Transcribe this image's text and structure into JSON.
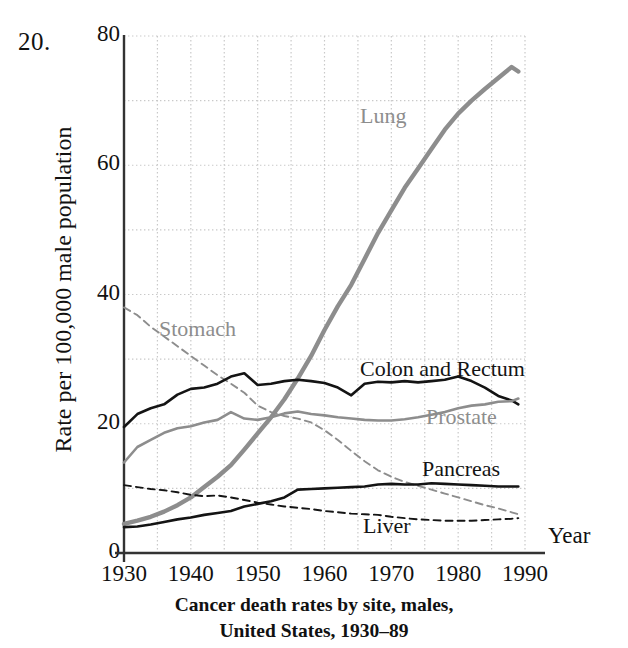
{
  "problem_number": "20.",
  "axis_x_name": "Year",
  "caption_line1": "Cancer death rates by site, males,",
  "caption_line2": "United States, 1930–89",
  "colors": {
    "black_series": "#141414",
    "gray_series": "#8d8d8d",
    "grid": "#c9c9c9",
    "axis": "#333333",
    "background": "#ffffff"
  },
  "labels": {
    "lung": "Lung",
    "stomach": "Stomach",
    "colon": "Colon and Rectum",
    "prostate": "Prostate",
    "pancreas": "Pancreas",
    "liver": "Liver"
  },
  "chart_data": {
    "type": "line",
    "title": "Cancer death rates by site, males, United States, 1930–89",
    "xlabel": "Year",
    "ylabel": "Rate per 100,000 male population",
    "xlim": [
      1930,
      1990
    ],
    "ylim": [
      0,
      80
    ],
    "xticks": [
      1930,
      1940,
      1950,
      1960,
      1970,
      1980,
      1990
    ],
    "yticks": [
      0,
      20,
      40,
      60,
      80
    ],
    "grid": "dotted, major at y every 10 and x every 5 years",
    "legend": "inline annotations next to each curve",
    "x": [
      1930,
      1932,
      1934,
      1936,
      1938,
      1940,
      1942,
      1944,
      1946,
      1948,
      1950,
      1952,
      1954,
      1956,
      1958,
      1960,
      1962,
      1964,
      1966,
      1968,
      1970,
      1972,
      1974,
      1976,
      1978,
      1980,
      1982,
      1984,
      1986,
      1988,
      1989
    ],
    "series": [
      {
        "name": "Lung",
        "style": "solid",
        "color": "#8d8d8d",
        "width": "thick",
        "values": [
          4.5,
          5.0,
          5.6,
          6.4,
          7.4,
          8.6,
          10.2,
          11.8,
          13.6,
          16.0,
          18.5,
          21.0,
          23.8,
          27.0,
          30.5,
          34.5,
          38.2,
          41.5,
          45.5,
          49.5,
          53.0,
          56.5,
          59.5,
          62.5,
          65.5,
          68.0,
          70.0,
          71.8,
          73.5,
          75.2,
          74.5
        ]
      },
      {
        "name": "Stomach",
        "style": "dashed",
        "color": "#8d8d8d",
        "width": "thin",
        "values": [
          38.0,
          36.8,
          35.0,
          33.5,
          32.0,
          30.5,
          29.0,
          27.5,
          26.2,
          24.8,
          22.8,
          21.8,
          21.2,
          20.8,
          20.2,
          19.0,
          17.5,
          15.8,
          14.2,
          12.8,
          11.8,
          11.0,
          10.4,
          9.8,
          9.2,
          8.6,
          8.0,
          7.4,
          6.9,
          6.3,
          6.0
        ]
      },
      {
        "name": "Colon and Rectum",
        "style": "solid",
        "color": "#141414",
        "width": "medium",
        "values": [
          19.5,
          21.5,
          22.4,
          23.0,
          24.5,
          25.4,
          25.6,
          26.2,
          27.3,
          27.8,
          26.0,
          26.2,
          26.6,
          26.8,
          26.6,
          26.3,
          25.6,
          24.4,
          26.2,
          26.5,
          26.4,
          26.6,
          26.4,
          26.6,
          26.8,
          27.3,
          26.6,
          25.6,
          24.3,
          23.6,
          23.0
        ]
      },
      {
        "name": "Prostate",
        "style": "solid",
        "color": "#8d8d8d",
        "width": "medium",
        "values": [
          14.0,
          16.4,
          17.5,
          18.6,
          19.3,
          19.6,
          20.2,
          20.6,
          21.8,
          20.8,
          20.6,
          21.0,
          21.6,
          21.9,
          21.5,
          21.3,
          21.0,
          20.8,
          20.6,
          20.5,
          20.5,
          20.7,
          21.0,
          21.4,
          21.8,
          22.4,
          22.8,
          23.0,
          23.4,
          23.5,
          23.9
        ]
      },
      {
        "name": "Pancreas",
        "style": "solid",
        "color": "#141414",
        "width": "medium",
        "values": [
          4.0,
          4.1,
          4.4,
          4.8,
          5.2,
          5.5,
          5.9,
          6.2,
          6.5,
          7.2,
          7.6,
          8.0,
          8.6,
          9.8,
          9.9,
          10.0,
          10.1,
          10.2,
          10.3,
          10.6,
          10.7,
          10.6,
          10.6,
          10.8,
          10.7,
          10.6,
          10.5,
          10.4,
          10.3,
          10.3,
          10.3
        ]
      },
      {
        "name": "Liver",
        "style": "dashed",
        "color": "#141414",
        "width": "thin",
        "values": [
          10.5,
          10.2,
          9.9,
          9.7,
          9.4,
          9.0,
          8.8,
          8.9,
          8.6,
          8.2,
          7.8,
          7.5,
          7.2,
          7.0,
          6.8,
          6.5,
          6.3,
          6.1,
          6.0,
          5.9,
          5.6,
          5.4,
          5.2,
          5.1,
          5.0,
          5.0,
          5.0,
          5.1,
          5.2,
          5.3,
          5.4
        ]
      }
    ]
  }
}
